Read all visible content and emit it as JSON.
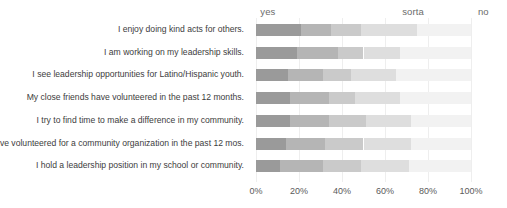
{
  "chart_data": {
    "type": "bar",
    "orientation": "horizontal",
    "stacked": true,
    "percent": true,
    "title": "",
    "subtitle": "",
    "xlabel": "",
    "ylabel": "",
    "xlim": [
      0,
      100
    ],
    "grid": true,
    "legend_position": "top",
    "group_headers": [
      {
        "label": "yes",
        "x_percent": 2
      },
      {
        "label": "sorta",
        "x_percent": 68
      },
      {
        "label": "no",
        "x_percent": 106
      }
    ],
    "tick_labels": [
      "0%",
      "20%",
      "40%",
      "60%",
      "80%",
      "100%"
    ],
    "tick_values": [
      0,
      20,
      40,
      60,
      80,
      100
    ],
    "series": [
      {
        "name": "yes-strong",
        "color": "#9a9a9a"
      },
      {
        "name": "yes-mild",
        "color": "#b5b5b5"
      },
      {
        "name": "sorta-mild",
        "color": "#cacaca"
      },
      {
        "name": "sorta-light",
        "color": "#dedede"
      },
      {
        "name": "no",
        "color": "#f2f2f2"
      }
    ],
    "categories": [
      "I enjoy doing kind acts for others.",
      "I am working on my leadership skills.",
      "I see leadership opportunities for Latino/Hispanic youth.",
      "My close friends have volunteered in the past 12 months.",
      "I try to find time to make a difference in my community.",
      "I have volunteered for a community organization in the past 12 mos.",
      "I hold a leadership position in my school or community."
    ],
    "rows": [
      {
        "category": "I enjoy doing kind acts for others.",
        "values": [
          21,
          14,
          14,
          26,
          25
        ]
      },
      {
        "category": "I am working on my leadership skills.",
        "values": [
          19,
          19,
          12,
          17,
          33
        ]
      },
      {
        "category": "I see leadership opportunities for Latino/Hispanic youth.",
        "values": [
          15,
          16,
          13,
          21,
          35
        ]
      },
      {
        "category": "My close friends have volunteered in the past 12 months.",
        "values": [
          16,
          18,
          12,
          21,
          33
        ]
      },
      {
        "category": "I try to find time to make a difference in my community.",
        "values": [
          16,
          18,
          17,
          21,
          28
        ]
      },
      {
        "category": "I have volunteered for a community organization in the past 12 mos.",
        "values": [
          14,
          18,
          18,
          22,
          28
        ]
      },
      {
        "category": "I hold a leadership position in my school or community.",
        "values": [
          11,
          20,
          18,
          22,
          29
        ]
      }
    ]
  },
  "colors": {
    "background": "#ffffff",
    "gridline": "#eeeeee",
    "label_text": "#3d3d3d",
    "tick_text": "#5a5a5a",
    "header_text": "#6b6b6b"
  }
}
